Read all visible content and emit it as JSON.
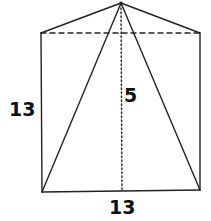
{
  "diagram": {
    "type": "pyramid-on-prism",
    "colors": {
      "stroke": "#222222",
      "background": "#ffffff"
    },
    "points": {
      "apex": [
        121,
        3
      ],
      "top_left": [
        41,
        33
      ],
      "top_right": [
        200,
        33
      ],
      "bottom_left": [
        42,
        192
      ],
      "bottom_right": [
        200,
        190
      ],
      "height_foot": [
        122,
        191
      ]
    },
    "labels": {
      "left_side": "13",
      "height": "5",
      "bottom_side": "13"
    }
  }
}
